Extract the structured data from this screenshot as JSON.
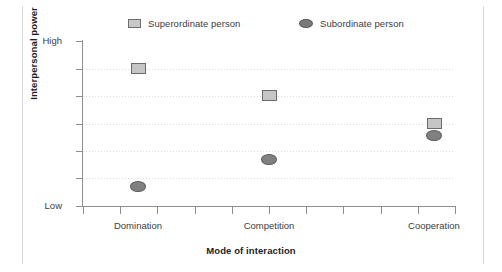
{
  "chart_data": {
    "type": "scatter",
    "title": "",
    "xlabel": "Mode of interaction",
    "ylabel": "Interpersonal power",
    "categories": [
      "Domination",
      "Competition",
      "Cooperation"
    ],
    "grid": true,
    "legend_position": "top",
    "ylim": [
      0,
      1
    ],
    "y_tick_labels": [
      "High",
      "",
      "",
      "",
      "",
      "",
      "Low"
    ],
    "y_tick_values": [
      1,
      0.8333,
      0.6667,
      0.5,
      0.3333,
      0.1667,
      0
    ],
    "y_axis_note": "Ordinal axis: only the extremes are labeled, High at top and Low at bottom",
    "x_tick_count": 11,
    "series": [
      {
        "name": "Superordinate person",
        "marker": "square",
        "fill": "#c6c6c6",
        "stroke": "#6b6b6b",
        "values": [
          0.8333,
          0.6667,
          0.5
        ],
        "points": [
          {
            "category": "Domination",
            "value": 0.8333
          },
          {
            "category": "Competition",
            "value": 0.6667
          },
          {
            "category": "Cooperation",
            "value": 0.5
          }
        ]
      },
      {
        "name": "Subordinate person",
        "marker": "ellipse",
        "fill": "#808080",
        "stroke": "#5c5c5c",
        "values": [
          0.12,
          0.28,
          0.43
        ],
        "points": [
          {
            "category": "Domination",
            "value": 0.12
          },
          {
            "category": "Competition",
            "value": 0.28
          },
          {
            "category": "Cooperation",
            "value": 0.43
          }
        ]
      }
    ]
  },
  "legend": {
    "items": [
      {
        "label": "Superordinate person",
        "marker": "square-marker-icon"
      },
      {
        "label": "Subordinate person",
        "marker": "ellipse-marker-icon"
      }
    ]
  },
  "axes": {
    "y_title": "Interpersonal power",
    "x_title": "Mode of interaction",
    "y_high_label": "High",
    "y_low_label": "Low"
  },
  "colors": {
    "axis": "#8e8e8e",
    "grid": "#dcdcdc",
    "text": "#3d3d3d",
    "title_text": "#1d1d1d",
    "background": "#ffffff",
    "superordinate_fill": "#c6c6c6",
    "subordinate_fill": "#808080"
  }
}
